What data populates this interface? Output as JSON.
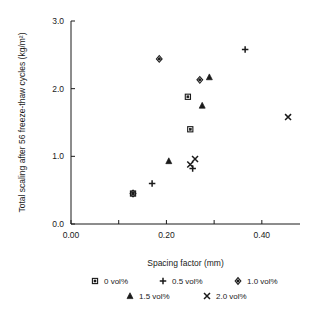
{
  "chart_data": {
    "type": "scatter",
    "title": "",
    "xlabel": "Spacing factor (mm)",
    "ylabel": "Total scaling after 56 freeze-thaw cycles (kg/m²)",
    "xlim": [
      0.0,
      0.48
    ],
    "ylim": [
      0.0,
      3.0
    ],
    "xticks": [
      0.0,
      0.1,
      0.2,
      0.3,
      0.4
    ],
    "xtick_labels": [
      "0.00",
      "",
      "0.20",
      "",
      "0.40"
    ],
    "yticks": [
      0.0,
      1.0,
      2.0,
      3.0
    ],
    "ytick_labels": [
      "0.0",
      "1.0",
      "2.0",
      "3.0"
    ],
    "grid": false,
    "legend_position": "bottom",
    "series": [
      {
        "name": "0 vol%",
        "marker": "square",
        "points": [
          {
            "x": 0.13,
            "y": 0.45
          },
          {
            "x": 0.245,
            "y": 1.88
          },
          {
            "x": 0.25,
            "y": 1.4
          }
        ]
      },
      {
        "name": "0.5 vol%",
        "marker": "plus",
        "points": [
          {
            "x": 0.17,
            "y": 0.6
          },
          {
            "x": 0.255,
            "y": 0.82
          },
          {
            "x": 0.365,
            "y": 2.58
          }
        ]
      },
      {
        "name": "1.0 vol%",
        "marker": "diamond",
        "points": [
          {
            "x": 0.13,
            "y": 0.45
          },
          {
            "x": 0.185,
            "y": 2.44
          },
          {
            "x": 0.27,
            "y": 2.13
          }
        ]
      },
      {
        "name": "1.5 vol%",
        "marker": "triangle",
        "points": [
          {
            "x": 0.205,
            "y": 0.93
          },
          {
            "x": 0.275,
            "y": 1.75
          },
          {
            "x": 0.29,
            "y": 2.17
          }
        ]
      },
      {
        "name": "2.0 vol%",
        "marker": "cross",
        "points": [
          {
            "x": 0.25,
            "y": 0.88
          },
          {
            "x": 0.26,
            "y": 0.96
          },
          {
            "x": 0.455,
            "y": 1.58
          }
        ]
      }
    ]
  },
  "legend": {
    "rows": [
      [
        {
          "label": "0 vol%",
          "marker": "square"
        },
        {
          "label": "0.5 vol%",
          "marker": "plus"
        },
        {
          "label": "1.0 vol%",
          "marker": "diamond"
        }
      ],
      [
        {
          "label": "1.5 vol%",
          "marker": "triangle"
        },
        {
          "label": "2.0 vol%",
          "marker": "cross"
        }
      ]
    ]
  },
  "colors": {
    "ink": "#1a1a1a",
    "background": "#ffffff"
  }
}
